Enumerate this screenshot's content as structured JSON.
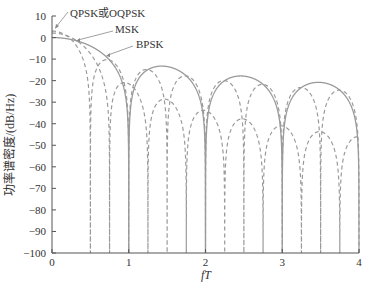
{
  "chart_data": {
    "type": "line",
    "title": "",
    "xlabel": "fT",
    "ylabel": "功率谱密度/(dB/Hz)",
    "xlim": [
      0,
      4
    ],
    "ylim": [
      -100,
      10
    ],
    "xticks": [
      "0",
      "1",
      "2",
      "3",
      "4"
    ],
    "yticks": [
      "10",
      "0",
      "-10",
      "-20",
      "-30",
      "-40",
      "-50",
      "-60",
      "-70",
      "-80",
      "-90",
      "-100"
    ],
    "grid": false,
    "legend": "annotations",
    "series": [
      {
        "name": "QPSK或OQPSK",
        "style": "dashed",
        "formula": "10*log10(2*sinc^2(2fT))",
        "peak_db": 3,
        "nulls": [
          0.5,
          1,
          1.5,
          2,
          2.5,
          3,
          3.5,
          4
        ]
      },
      {
        "name": "MSK",
        "style": "dashed",
        "formula": "10*log10((16/pi^2)*(cos(2*pi*fT)/(1-16 fT^2))^2)",
        "peak_db": 2.1,
        "nulls": [
          0.75,
          1.25,
          1.75,
          2.25,
          2.75,
          3.25,
          3.75
        ]
      },
      {
        "name": "BPSK",
        "style": "solid",
        "formula": "10*log10(sinc^2(fT))",
        "peak_db": 0,
        "nulls": [
          1,
          2,
          3,
          4
        ],
        "sidelobe_peaks_db": [
          -13.5,
          -17.9,
          -20.8
        ]
      }
    ],
    "annotations": [
      {
        "text": "QPSK或OQPSK",
        "points_to": "QPSK curve near fT≈0"
      },
      {
        "text": "MSK",
        "points_to": "MSK curve near fT≈0.3"
      },
      {
        "text": "BPSK",
        "points_to": "BPSK curve near fT≈0.6"
      }
    ],
    "colors": {
      "lines": "#9a9a9a",
      "axis": "#555555",
      "text": "#333333"
    }
  },
  "labels": {
    "xlabel": "fT",
    "ylabel": "功率谱密度/(dB/Hz)",
    "anno_qpsk": "QPSK或OQPSK",
    "anno_msk": "MSK",
    "anno_bpsk": "BPSK"
  }
}
